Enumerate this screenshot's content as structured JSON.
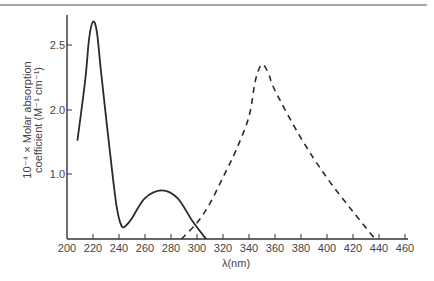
{
  "chart_data": {
    "type": "line",
    "title": "",
    "xlabel": "λ(nm)",
    "ylabel_line1": "10⁻⁴ × Molar absorption",
    "ylabel_line2": "coefficient (M⁻¹ cm⁻¹)",
    "xlim": [
      200,
      460
    ],
    "x_ticks": [
      200,
      220,
      240,
      260,
      280,
      300,
      320,
      340,
      360,
      380,
      400,
      420,
      440,
      460
    ],
    "y_ticks": [
      {
        "value": 1.0,
        "label": "1.0"
      },
      {
        "value": 2.0,
        "label": "2.0"
      },
      {
        "value": 2.5,
        "label": "2.5"
      }
    ],
    "grid": false,
    "legend": null,
    "series": [
      {
        "name": "solid",
        "style": "solid",
        "x": [
          208,
          214,
          217,
          220,
          223,
          226,
          232,
          238,
          242,
          246,
          250,
          260,
          273,
          285,
          297,
          307
        ],
        "y": [
          1.52,
          2.23,
          2.55,
          2.68,
          2.6,
          2.31,
          1.53,
          0.52,
          0.2,
          0.22,
          0.32,
          0.63,
          0.75,
          0.63,
          0.26,
          0.0
        ]
      },
      {
        "name": "dashed",
        "style": "dashed",
        "x": [
          288,
          300,
          310,
          320,
          330,
          340,
          345,
          350,
          355,
          360,
          380,
          400,
          420,
          437
        ],
        "y": [
          0.0,
          0.25,
          0.55,
          0.95,
          1.37,
          1.9,
          2.23,
          2.35,
          2.28,
          2.15,
          1.56,
          0.94,
          0.42,
          0.0
        ]
      }
    ]
  },
  "colors": {
    "line": "#2a2a2a",
    "axis": "#333333",
    "top_rule": "#8a8a8a"
  }
}
